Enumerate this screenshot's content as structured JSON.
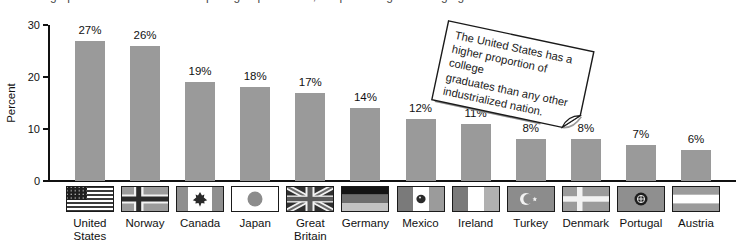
{
  "caption": {
    "clipped_text": "Bar graphs are often used to compare groups — here, the percentage of college graduates in industrialized nations.",
    "clipped": true
  },
  "axes": {
    "ylabel": "Percent",
    "ytick_labels": [
      "0",
      "10",
      "20",
      "30"
    ]
  },
  "note": {
    "lines": [
      "The United States has a",
      "higher proportion of college",
      "graduates than any other",
      "industrialized nation."
    ],
    "full_text": "The United States has a higher proportion of college graduates than any other industrialized nation."
  },
  "chart_data": {
    "type": "bar",
    "title": "",
    "xlabel": "",
    "ylabel": "Percent",
    "categories": [
      "United States",
      "Norway",
      "Canada",
      "Japan",
      "Great Britain",
      "Germany",
      "Mexico",
      "Ireland",
      "Turkey",
      "Denmark",
      "Portugal",
      "Austria"
    ],
    "category_label_lines": [
      [
        "United",
        "States"
      ],
      [
        "Norway"
      ],
      [
        "Canada"
      ],
      [
        "Japan"
      ],
      [
        "Great",
        "Britain"
      ],
      [
        "Germany"
      ],
      [
        "Mexico"
      ],
      [
        "Ireland"
      ],
      [
        "Turkey"
      ],
      [
        "Denmark"
      ],
      [
        "Portugal"
      ],
      [
        "Austria"
      ]
    ],
    "values": [
      27,
      26,
      19,
      18,
      17,
      14,
      12,
      11,
      8,
      8,
      7,
      6
    ],
    "value_labels": [
      "27%",
      "26%",
      "19%",
      "18%",
      "17%",
      "14%",
      "12%",
      "11%",
      "8%",
      "8%",
      "7%",
      "6%"
    ],
    "flag_icons": [
      "united-states-flag-icon",
      "norway-flag-icon",
      "canada-flag-icon",
      "japan-flag-icon",
      "great-britain-flag-icon",
      "germany-flag-icon",
      "mexico-flag-icon",
      "ireland-flag-icon",
      "turkey-flag-icon",
      "denmark-flag-icon",
      "portugal-flag-icon",
      "austria-flag-icon"
    ],
    "yticks": [
      0,
      10,
      20,
      30
    ],
    "ylim": [
      0,
      30
    ],
    "grid": false,
    "legend": "none",
    "bar_color": "#9a9a9a",
    "annotation": "The United States has a higher proportion of college graduates than any other industrialized nation."
  }
}
